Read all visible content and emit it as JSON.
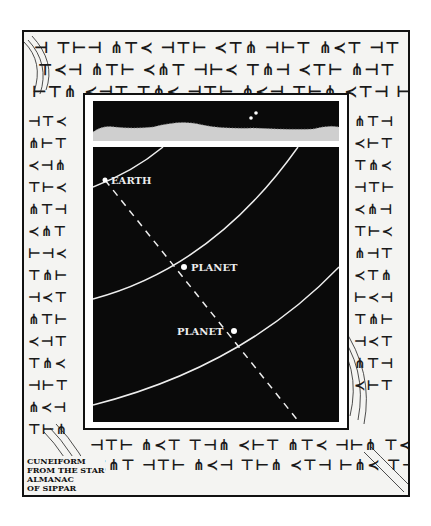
{
  "figure": {
    "sky_strip": {
      "stars": 2,
      "terrain": "horizon-mountains"
    },
    "diagram": {
      "labels": {
        "earth": "EARTH",
        "planet_near": "PLANET",
        "planet_far": "PLANET"
      },
      "orbits": 3,
      "sightline": "dashed"
    },
    "caption": {
      "line1": "CUNEIFORM",
      "line2": "FROM THE STAR",
      "line3": "ALMANAC",
      "line4": "OF SIPPAR"
    },
    "border_glyphs": [
      "𒀭𒈹𒋫𒀀𒁀𒌋𒂊𒈠𒋾𒀸𒁹",
      "𒋛𒀀𒁲𒈬𒌓𒂗𒄿𒋗𒅁𒆠",
      "𒉡𒊺𒈾𒌅𒁕𒄑𒀭𒆳𒁍𒂍"
    ],
    "colors": {
      "ink": "#111111",
      "paper": "#f4f4f2",
      "sky": "#0a0a0a",
      "line": "#eeeeee"
    }
  }
}
